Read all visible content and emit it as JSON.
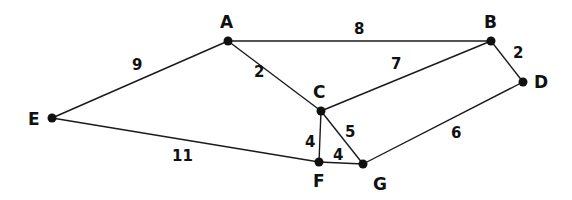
{
  "graph": {
    "nodes": [
      {
        "id": "A",
        "x": 228,
        "y": 41,
        "lx": 220,
        "ly": 28
      },
      {
        "id": "B",
        "x": 491,
        "y": 41,
        "lx": 484,
        "ly": 28
      },
      {
        "id": "C",
        "x": 321,
        "y": 111,
        "lx": 313,
        "ly": 98
      },
      {
        "id": "D",
        "x": 523,
        "y": 82,
        "lx": 534,
        "ly": 88
      },
      {
        "id": "E",
        "x": 52,
        "y": 118,
        "lx": 28,
        "ly": 125
      },
      {
        "id": "F",
        "x": 319,
        "y": 162,
        "lx": 313,
        "ly": 187
      },
      {
        "id": "G",
        "x": 363,
        "y": 164,
        "lx": 373,
        "ly": 190
      }
    ],
    "edges": [
      {
        "from": "A",
        "to": "B",
        "weight": "8",
        "lx": 354,
        "ly": 34
      },
      {
        "from": "A",
        "to": "C",
        "weight": "2",
        "lx": 254,
        "ly": 77
      },
      {
        "from": "A",
        "to": "E",
        "weight": "9",
        "lx": 132,
        "ly": 70
      },
      {
        "from": "B",
        "to": "C",
        "weight": "7",
        "lx": 391,
        "ly": 69
      },
      {
        "from": "B",
        "to": "D",
        "weight": "2",
        "lx": 513,
        "ly": 58
      },
      {
        "from": "C",
        "to": "F",
        "weight": "4",
        "lx": 305,
        "ly": 147
      },
      {
        "from": "C",
        "to": "G",
        "weight": "5",
        "lx": 345,
        "ly": 137
      },
      {
        "from": "E",
        "to": "F",
        "weight": "11",
        "lx": 172,
        "ly": 161
      },
      {
        "from": "F",
        "to": "G",
        "weight": "4",
        "lx": 333,
        "ly": 160
      },
      {
        "from": "D",
        "to": "G",
        "weight": "6",
        "lx": 451,
        "ly": 138
      }
    ]
  }
}
